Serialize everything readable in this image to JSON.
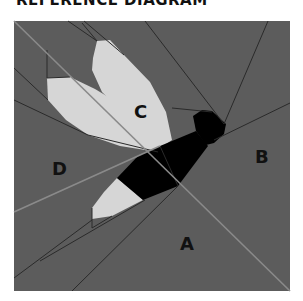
{
  "title": "REFERENCE DIAGRAM",
  "colors": {
    "background": "#5c5c5c",
    "wing": "#d6d6d6",
    "body": "#000000",
    "seam_light": "#8a8a8a",
    "seam_dark": "#2a2a2a"
  },
  "labels": {
    "a": "A",
    "b": "B",
    "c": "C",
    "d": "D"
  }
}
